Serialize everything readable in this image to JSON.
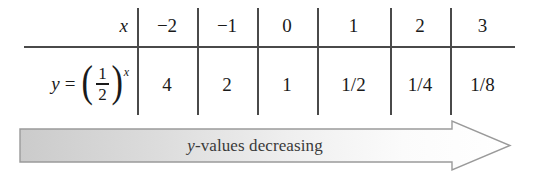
{
  "figure": {
    "type": "math-table-with-arrow",
    "table": {
      "row_labels": {
        "x_label": "x",
        "y_label_parts": {
          "variable": "y",
          "equals": "=",
          "left_paren": "(",
          "numerator": "1",
          "denominator": "2",
          "right_paren": ")",
          "exponent": "x"
        }
      },
      "x_values": [
        "−2",
        "−1",
        "0",
        "1",
        "2",
        "3"
      ],
      "y_values": [
        "4",
        "2",
        "1",
        "1/2",
        "1/4",
        "1/8"
      ]
    },
    "annotation": {
      "italic_prefix": "y",
      "text": "-values decreasing",
      "full_text": "y-values decreasing",
      "direction": "right"
    },
    "colors": {
      "rule": "#4a4a4a",
      "text": "#1a1a1a",
      "annotation_text": "#3a3a3a",
      "arrow_outline": "#9a9a9a",
      "arrow_fill_start": "#cdcdcd",
      "arrow_fill_end": "#ffffff",
      "background": "#ffffff"
    }
  }
}
